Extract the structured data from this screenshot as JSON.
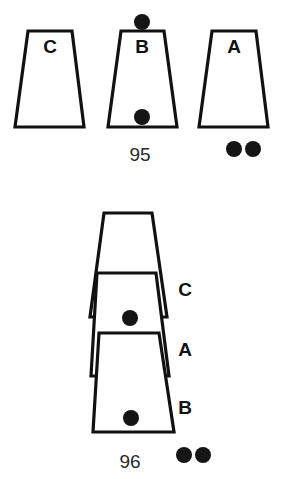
{
  "figure": {
    "caption_top": "",
    "background_color": "#ffffff",
    "ink_color": "#111111",
    "dot_color": "#151515",
    "panels": [
      {
        "id": "panel-95",
        "number": "95",
        "arrangement": "side-by-side",
        "shapes": [
          {
            "label": "C",
            "label_position": "inside-top",
            "top_left_x": 28,
            "top_right_x": 72,
            "top_y": 31,
            "bottom_left_x": 15,
            "bottom_right_x": 84,
            "bottom_y": 127,
            "label_x": 50,
            "label_y": 48,
            "dots": []
          },
          {
            "label": "B",
            "label_position": "inside-top",
            "top_left_x": 121,
            "top_right_x": 164,
            "top_y": 31,
            "bottom_left_x": 108,
            "bottom_right_x": 177,
            "bottom_y": 127,
            "label_x": 142,
            "label_y": 48,
            "dots": [
              {
                "cx": 142,
                "cy": 22,
                "r": 8,
                "where": "above-top-edge"
              },
              {
                "cx": 142,
                "cy": 117,
                "r": 8,
                "where": "inside-bottom"
              }
            ]
          },
          {
            "label": "A",
            "label_position": "inside-top",
            "top_left_x": 212,
            "top_right_x": 256,
            "top_y": 31,
            "bottom_left_x": 199,
            "bottom_right_x": 268,
            "bottom_y": 127,
            "label_x": 234,
            "label_y": 48,
            "dots": []
          }
        ],
        "loose_dots": [
          {
            "cx": 234,
            "cy": 149,
            "r": 8
          },
          {
            "cx": 253,
            "cy": 149,
            "r": 8
          }
        ],
        "number_x": 140,
        "number_y": 156
      },
      {
        "id": "panel-96",
        "number": "96",
        "arrangement": "stacked-nested",
        "shapes": [
          {
            "label": "C",
            "label_position": "outside-right",
            "top_left_x": 104,
            "top_right_x": 152,
            "top_y": 213,
            "bottom_left_x": 90,
            "bottom_right_x": 167,
            "bottom_y": 317,
            "label_x": 185,
            "label_y": 291,
            "dots": []
          },
          {
            "label": "A",
            "label_position": "outside-right",
            "top_left_x": 97,
            "top_right_x": 156,
            "top_y": 273,
            "bottom_left_x": 91,
            "bottom_right_x": 169,
            "bottom_y": 376,
            "label_x": 185,
            "label_y": 351,
            "dots": [
              {
                "cx": 130,
                "cy": 318,
                "r": 8,
                "where": "inside-bottom"
              }
            ]
          },
          {
            "label": "B",
            "label_position": "outside-right",
            "top_left_x": 99,
            "top_right_x": 159,
            "top_y": 333,
            "bottom_left_x": 93,
            "bottom_right_x": 174,
            "bottom_y": 432,
            "label_x": 185,
            "label_y": 409,
            "dots": [
              {
                "cx": 131,
                "cy": 418,
                "r": 8,
                "where": "inside-bottom"
              }
            ]
          }
        ],
        "loose_dots": [
          {
            "cx": 184,
            "cy": 455,
            "r": 8
          },
          {
            "cx": 203,
            "cy": 455,
            "r": 8
          }
        ],
        "number_x": 130,
        "number_y": 463
      }
    ]
  }
}
